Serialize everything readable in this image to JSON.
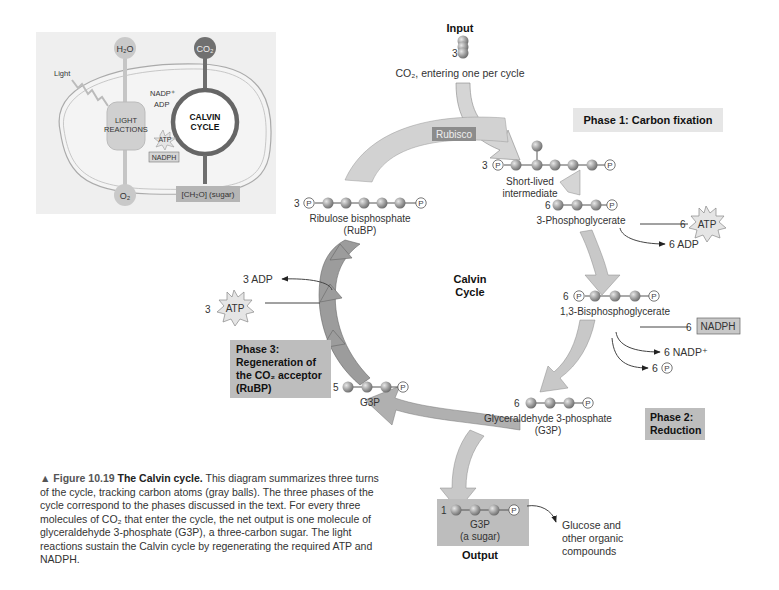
{
  "inset": {
    "h2o": "H₂O",
    "co2": "CO₂",
    "light": "Light",
    "nadp_plus": "NADP⁺",
    "adp": "ADP",
    "light_reactions_1": "LIGHT",
    "light_reactions_2": "REACTIONS",
    "atp": "ATP",
    "nadph": "NADPH",
    "calvin_1": "CALVIN",
    "calvin_2": "CYCLE",
    "o2": "O₂",
    "sugar": "[CH₂O] (sugar)"
  },
  "input": {
    "title": "Input",
    "count": "3",
    "label": "CO₂, entering one per cycle"
  },
  "rubisco": "Rubisco",
  "phase1": "Phase 1: Carbon fixation",
  "phase2_1": "Phase 2:",
  "phase2_2": "Reduction",
  "phase3": [
    "Phase 3:",
    "Regeneration of",
    "the CO₂ acceptor",
    "(RuBP)"
  ],
  "center": [
    "Calvin",
    "Cycle"
  ],
  "molecules": {
    "intermediate": {
      "count": "3",
      "label_1": "Short-lived",
      "label_2": "intermediate"
    },
    "pga": {
      "count": "6",
      "label": "3-Phosphoglycerate"
    },
    "bpg": {
      "count": "6",
      "label": "1,3-Bisphosphoglycerate"
    },
    "g3p": {
      "count": "6",
      "label_1": "Glyceraldehyde 3-phosphate",
      "label_2": "(G3P)"
    },
    "g3p5": {
      "count": "5",
      "label": "G3P"
    },
    "rubp": {
      "count": "3",
      "label_1": "Ribulose bisphosphate",
      "label_2": "(RuBP)"
    },
    "output": {
      "count": "1",
      "label_1": "G3P",
      "label_2": "(a sugar)",
      "title": "Output"
    }
  },
  "reactants": {
    "atp_in_count": "6",
    "atp": "ATP",
    "adp_out": "6 ADP",
    "nadph_in_count": "6",
    "nadph": "NADPH",
    "nadp_out": "6 NADP⁺",
    "pi_count": "6",
    "atp3_count": "3",
    "adp3_out": "3 ADP"
  },
  "glucose": [
    "Glucose and",
    "other organic",
    "compounds"
  ],
  "caption": {
    "figure": "▲ Figure 10.19",
    "title": "The Calvin cycle.",
    "body": "This diagram summarizes three turns of the cycle, tracking carbon atoms (gray balls). The three phases of the cycle correspond to the phases discussed in the text. For every three molecules of CO₂ that enter the cycle, the net output is one molecule of glyceraldehyde 3-phosphate (G3P), a three-carbon sugar. The light reactions sustain the Calvin cycle by regenerating the required ATP and NADPH."
  },
  "colors": {
    "arrow": "#c8c8c8",
    "arrow_dark": "#8f8f8f",
    "phase_box": "#bdbdbd",
    "ball": "#9a9a9a"
  }
}
